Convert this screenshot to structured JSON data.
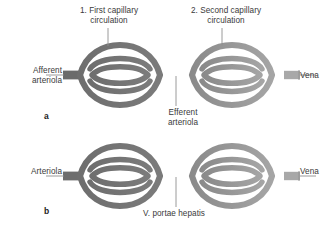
{
  "figure": {
    "colors": {
      "vessel_dark": "#6f6f6f",
      "vessel_mid": "#7d7d7d",
      "vessel_light": "#9a9a9a",
      "vessel_lighter": "#a9a9a9",
      "outline": "#5a5a5a",
      "leader_line": "#8a8a8a",
      "text": "#3a3a3a",
      "letter": "#1c1c1c",
      "background": "#ffffff"
    }
  },
  "panels": [
    {
      "letter": "a",
      "labels": {
        "first_capillary": "1. First capillary\ncirculation",
        "second_capillary": "2. Second capillary\ncirculation",
        "afferent": "Afferent\narteriola",
        "vena": "Vena",
        "efferent": "Efferent\narteriola"
      }
    },
    {
      "letter": "b",
      "labels": {
        "arteriola": "Arteriola",
        "vena": "Vena",
        "portal_vein": "V. portae hepatis"
      }
    }
  ]
}
